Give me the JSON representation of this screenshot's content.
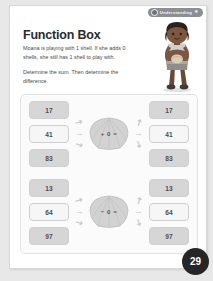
{
  "badge": {
    "icon": "circle-check-icon",
    "label": "Understanding",
    "star": "★"
  },
  "worksheet": {
    "title": "Function Box",
    "paragraph_1": "Moana is playing with 1 shell. If she adds 0 shells, she still has 1 shell to play with.",
    "paragraph_2": "Determine the sum. Then determine the difference."
  },
  "groups": [
    {
      "name": "addition-group",
      "operator": "+ 0 =",
      "inputs": [
        "17",
        "41",
        "83"
      ],
      "outputs": [
        "17",
        "41",
        "83"
      ]
    },
    {
      "name": "subtraction-group",
      "operator": "− 0 =",
      "inputs": [
        "13",
        "64",
        "97"
      ],
      "outputs": [
        "13",
        "64",
        "97"
      ]
    }
  ],
  "arrows": {
    "in_top": "↗",
    "in_mid": "→",
    "in_bot": "↘",
    "out_top": "↗",
    "out_mid": "→",
    "out_bot": "↘"
  },
  "page_number": "29",
  "colors": {
    "page_bg": "#e8e8e8",
    "sheet": "#ffffff",
    "badge": "#8b8f93",
    "box_dark": "#d6d6d6",
    "box_light": "#f6f6f6",
    "page_number_bg": "#262626"
  }
}
